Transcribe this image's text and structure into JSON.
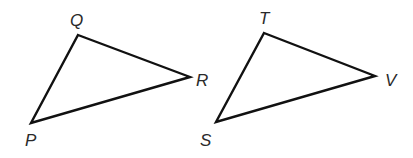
{
  "diagram": {
    "type": "two-triangles",
    "stroke_color": "#111111",
    "label_color": "#2a2a2a",
    "background": "#ffffff",
    "triangles": [
      {
        "name": "PQR",
        "vertices": [
          {
            "label": "Q",
            "x": 78,
            "y": 35,
            "label_x": 70,
            "label_y": 26
          },
          {
            "label": "R",
            "x": 190,
            "y": 77,
            "label_x": 196,
            "label_y": 86
          },
          {
            "label": "P",
            "x": 31,
            "y": 123,
            "label_x": 25,
            "label_y": 146
          }
        ]
      },
      {
        "name": "STV",
        "vertices": [
          {
            "label": "T",
            "x": 264,
            "y": 33,
            "label_x": 259,
            "label_y": 24
          },
          {
            "label": "V",
            "x": 375,
            "y": 76,
            "label_x": 385,
            "label_y": 86
          },
          {
            "label": "S",
            "x": 216,
            "y": 122,
            "label_x": 200,
            "label_y": 146
          }
        ]
      }
    ]
  },
  "labels": {
    "Q": "Q",
    "R": "R",
    "P": "P",
    "T": "T",
    "V": "V",
    "S": "S"
  }
}
